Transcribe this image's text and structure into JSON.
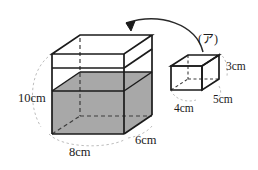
{
  "figure": {
    "colors": {
      "outline": "#1b1b1b",
      "water_fill": "#a8a8a8",
      "hidden_edge": "#4a4a4a",
      "guide_dash": "#b9b9b9",
      "background": "#ffffff",
      "text": "#1b1b1b"
    },
    "large_box": {
      "name": "water-tank",
      "labels": {
        "height": "10cm",
        "width": "8cm",
        "depth": "6cm"
      },
      "water_shaded": true
    },
    "small_box": {
      "name": "block-a",
      "tag": "(ア)",
      "labels": {
        "height": "3cm",
        "width": "4cm",
        "depth": "5cm"
      }
    },
    "arrow": {
      "name": "insert-arrow",
      "description": "curved arrow from block into tank"
    }
  }
}
